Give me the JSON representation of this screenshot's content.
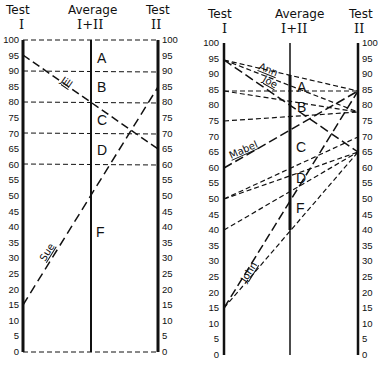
{
  "chart_data": [
    {
      "type": "line",
      "title": "Nomograph: averaging two test scores (graded)",
      "axes": [
        {
          "label_top": "Test",
          "label_bottom": "I",
          "range": [
            0,
            100
          ]
        },
        {
          "label_top": "Average",
          "label_bottom": "I+II",
          "range": [
            0,
            100
          ]
        },
        {
          "label_top": "Test",
          "label_bottom": "II",
          "range": [
            0,
            100
          ]
        }
      ],
      "ticks": [
        0,
        5,
        10,
        15,
        20,
        25,
        30,
        35,
        40,
        45,
        50,
        55,
        60,
        65,
        70,
        75,
        80,
        85,
        90,
        95,
        100
      ],
      "grade_boundaries": [
        100,
        90,
        80,
        70,
        60,
        0
      ],
      "grades": [
        {
          "label": "A",
          "from": 90,
          "to": 100
        },
        {
          "label": "B",
          "from": 80,
          "to": 90
        },
        {
          "label": "C",
          "from": 70,
          "to": 80
        },
        {
          "label": "D",
          "from": 60,
          "to": 70
        },
        {
          "label": "F",
          "from": 0,
          "to": 60
        }
      ],
      "series": [
        {
          "name": "Jill",
          "test1": 95,
          "test2": 65,
          "average": 80
        },
        {
          "name": "Sue",
          "test1": 15,
          "test2": 85,
          "average": 50
        }
      ]
    },
    {
      "type": "line",
      "title": "Nomograph: all combinations of scores",
      "axes": [
        {
          "label_top": "Test",
          "label_bottom": "I",
          "range": [
            0,
            100
          ]
        },
        {
          "label_top": "Average",
          "label_bottom": "I+II",
          "range": [
            0,
            100
          ]
        },
        {
          "label_top": "Test",
          "label_bottom": "II",
          "range": [
            0,
            100
          ]
        }
      ],
      "ticks": [
        0,
        5,
        10,
        15,
        20,
        25,
        30,
        35,
        40,
        45,
        50,
        55,
        60,
        65,
        70,
        75,
        80,
        85,
        90,
        95,
        100
      ],
      "grades": [
        {
          "label": "A",
          "y": 88
        },
        {
          "label": "B",
          "y": 81
        },
        {
          "label": "C",
          "y": 67
        },
        {
          "label": "D",
          "y": 57
        },
        {
          "label": "F",
          "y": 48
        }
      ],
      "series": [
        {
          "name": "Ann",
          "test1": 95,
          "test2": 85,
          "average": 90
        },
        {
          "name": "Joe",
          "test1": 95,
          "test2": 65,
          "average": 80
        },
        {
          "name": "",
          "test1": 95,
          "test2": 78
        },
        {
          "name": "",
          "test1": 85,
          "test2": 85
        },
        {
          "name": "",
          "test1": 85,
          "test2": 78
        },
        {
          "name": "",
          "test1": 75,
          "test2": 78
        },
        {
          "name": "Mabel",
          "test1": 60,
          "test2": 85,
          "average": 72.5
        },
        {
          "name": "",
          "test1": 50,
          "test2": 70
        },
        {
          "name": "",
          "test1": 50,
          "test2": 65
        },
        {
          "name": "",
          "test1": 40,
          "test2": 65
        },
        {
          "name": "John",
          "test1": 15,
          "test2": 85,
          "average": 50
        },
        {
          "name": "",
          "test1": 15,
          "test2": 65,
          "average": 40
        }
      ]
    }
  ],
  "left": {
    "header_test1": "Test",
    "header_test1_num": "I",
    "header_avg": "Average",
    "header_avg_num": "I+II",
    "header_test2": "Test",
    "header_test2_num": "II",
    "grades": [
      "A",
      "B",
      "C",
      "D",
      "F"
    ],
    "names": {
      "jill": "Jill",
      "sue": "Sue"
    }
  },
  "right": {
    "header_test1": "Test",
    "header_test1_num": "I",
    "header_avg": "Average",
    "header_avg_num": "I+II",
    "header_test2": "Test",
    "header_test2_num": "II",
    "grades": [
      "A",
      "B",
      "C",
      "D",
      "F"
    ],
    "names": {
      "ann": "Ann",
      "joe": "Joe",
      "mabel": "Mabel",
      "john": "John"
    }
  },
  "tick_labels": [
    "100",
    "95",
    "90",
    "85",
    "80",
    "75",
    "70",
    "65",
    "60",
    "55",
    "50",
    "45",
    "40",
    "35",
    "30",
    "25",
    "20",
    "15",
    "10",
    "5",
    "0"
  ]
}
